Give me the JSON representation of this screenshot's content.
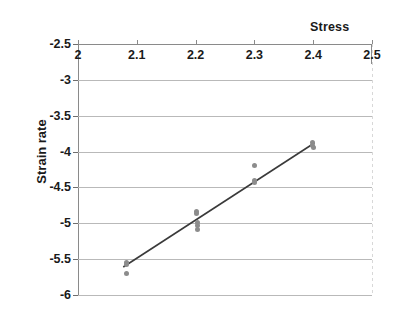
{
  "chart_data": {
    "type": "scatter",
    "title": "Stress",
    "xlabel": "Stress",
    "ylabel": "Strain rate",
    "xlim": [
      2.0,
      2.5
    ],
    "ylim": [
      -6.0,
      -2.5
    ],
    "x_ticks": [
      "2",
      "2.1",
      "2.2",
      "2.3",
      "2.4",
      "2.5"
    ],
    "x_tick_values": [
      2.0,
      2.1,
      2.2,
      2.3,
      2.4,
      2.5
    ],
    "y_ticks": [
      "-2.5",
      "-3",
      "-3.5",
      "-4",
      "-4.5",
      "-5",
      "-5.5",
      "-6"
    ],
    "y_tick_values": [
      -2.5,
      -3.0,
      -3.5,
      -4.0,
      -4.5,
      -5.0,
      -5.5,
      -6.0
    ],
    "x_axis_position": "top",
    "grid": "horizontal",
    "legend": "none",
    "point_color": "#8c8c8c",
    "line_color": "#3a3a3a",
    "grid_color": "#b9b9b9",
    "axis_color": "#8a8a8a",
    "points": [
      {
        "x": 2.082,
        "y": -5.54
      },
      {
        "x": 2.082,
        "y": -5.58
      },
      {
        "x": 2.083,
        "y": -5.7
      },
      {
        "x": 2.202,
        "y": -4.83
      },
      {
        "x": 2.202,
        "y": -4.87
      },
      {
        "x": 2.203,
        "y": -4.99
      },
      {
        "x": 2.203,
        "y": -5.03
      },
      {
        "x": 2.203,
        "y": -5.09
      },
      {
        "x": 2.3,
        "y": -4.19
      },
      {
        "x": 2.3,
        "y": -4.4
      },
      {
        "x": 2.301,
        "y": -4.43
      },
      {
        "x": 2.398,
        "y": -3.88
      },
      {
        "x": 2.399,
        "y": -3.92
      },
      {
        "x": 2.4,
        "y": -3.95
      }
    ],
    "trendline": {
      "x0": 2.077,
      "y0": -5.61,
      "x1": 2.402,
      "y1": -3.88
    }
  }
}
